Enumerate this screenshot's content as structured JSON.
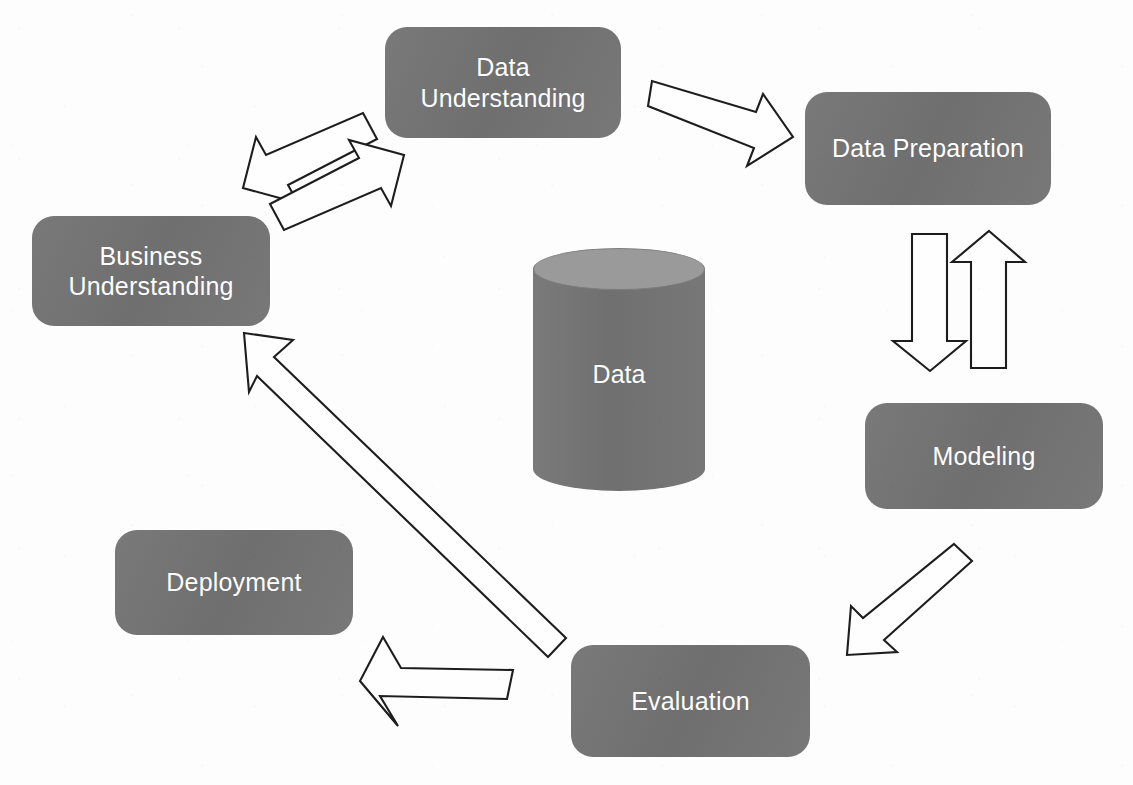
{
  "diagram": {
    "background_color": "#fdfdfd",
    "node_fill_color": "#737373",
    "node_text_color": "#ffffff",
    "arrow_fill_color": "#fefefe",
    "arrow_stroke_color": "#1d1d1d",
    "cylinder_top_color": "#9a9a9a"
  },
  "nodes": {
    "business_understanding": {
      "label": "Business\nUnderstanding",
      "font_size": 25
    },
    "data_understanding": {
      "label": "Data\nUnderstanding",
      "font_size": 25
    },
    "data_preparation": {
      "label": "Data Preparation",
      "font_size": 25
    },
    "modeling": {
      "label": "Modeling",
      "font_size": 25
    },
    "evaluation": {
      "label": "Evaluation",
      "font_size": 25
    },
    "deployment": {
      "label": "Deployment",
      "font_size": 25
    },
    "data_store": {
      "label": "Data",
      "font_size": 25
    }
  },
  "connections": [
    {
      "name": "business-to-data-understanding",
      "from": "Business Understanding",
      "to": "Data Understanding",
      "direction": "forward"
    },
    {
      "name": "data-understanding-to-business",
      "from": "Data Understanding",
      "to": "Business Understanding",
      "direction": "backward"
    },
    {
      "name": "data-understanding-to-data-preparation",
      "from": "Data Understanding",
      "to": "Data Preparation",
      "direction": "forward"
    },
    {
      "name": "data-preparation-to-modeling",
      "from": "Data Preparation",
      "to": "Modeling",
      "direction": "forward"
    },
    {
      "name": "modeling-to-data-preparation",
      "from": "Modeling",
      "to": "Data Preparation",
      "direction": "backward"
    },
    {
      "name": "modeling-to-evaluation",
      "from": "Modeling",
      "to": "Evaluation",
      "direction": "forward"
    },
    {
      "name": "evaluation-to-deployment",
      "from": "Evaluation",
      "to": "Deployment",
      "direction": "forward"
    },
    {
      "name": "evaluation-to-business-understanding",
      "from": "Evaluation",
      "to": "Business Understanding",
      "direction": "backward"
    }
  ]
}
